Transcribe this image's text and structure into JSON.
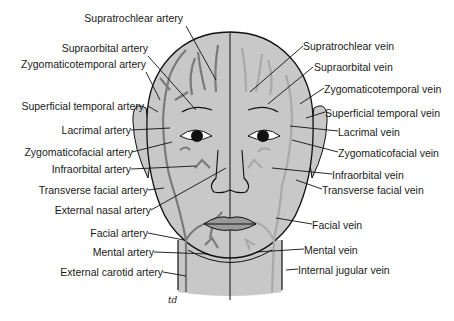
{
  "figure": {
    "colors": {
      "background": "#ffffff",
      "skin": "#c8c8c8",
      "artery": "#7a7a7a",
      "vein": "#a9a9a9",
      "outline": "#111111",
      "label_text": "#1a1a1a"
    },
    "left_labels": [
      {
        "text": "Supratrochlear artery",
        "x": 225,
        "y": 18
      },
      {
        "text": "Supraorbital artery",
        "x": 148,
        "y": 48
      },
      {
        "text": "Zygomaticotemporal artery",
        "x": 148,
        "y": 64
      },
      {
        "text": "Superficial temporal artery",
        "x": 147,
        "y": 101
      },
      {
        "text": "Lacrimal artery",
        "x": 131,
        "y": 125
      },
      {
        "text": "Zygomaticofacial artery",
        "x": 132,
        "y": 147
      },
      {
        "text": "Infraorbital artery",
        "x": 131,
        "y": 164
      },
      {
        "text": "Transverse facial artery",
        "x": 148,
        "y": 185
      },
      {
        "text": "External nasal artery",
        "x": 151,
        "y": 205
      },
      {
        "text": "Facial artery",
        "x": 148,
        "y": 228
      },
      {
        "text": "Mental artery",
        "x": 154,
        "y": 247
      },
      {
        "text": "External carotid artery",
        "x": 163,
        "y": 267
      }
    ],
    "right_labels": [
      {
        "text": "Supratrochlear vein",
        "x": 303,
        "y": 40
      },
      {
        "text": "Supraorbital vein",
        "x": 313,
        "y": 61
      },
      {
        "text": "Zygomaticotemporal vein",
        "x": 324,
        "y": 83
      },
      {
        "text": "Superficial temporal vein",
        "x": 325,
        "y": 107
      },
      {
        "text": "Lacrimal vein",
        "x": 338,
        "y": 126
      },
      {
        "text": "Zygomaticofacial vein",
        "x": 338,
        "y": 147
      },
      {
        "text": "Infraorbital vein",
        "x": 332,
        "y": 169
      },
      {
        "text": "Transverse facial vein",
        "x": 322,
        "y": 184
      },
      {
        "text": "Facial vein",
        "x": 312,
        "y": 219
      },
      {
        "text": "Mental vein",
        "x": 304,
        "y": 244
      },
      {
        "text": "Internal jugular vein",
        "x": 298,
        "y": 264
      }
    ],
    "signature": "td"
  }
}
